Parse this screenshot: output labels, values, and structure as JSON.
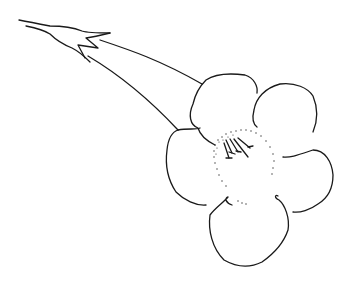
{
  "image": {
    "subject": "flower line drawing",
    "description": "Trumpet-shaped flower with long tubular corolla, calyx at left, five rounded petals, dotted throat and stamens",
    "colors": {
      "background": "#ffffff",
      "ink": "#1a1a1a"
    }
  }
}
